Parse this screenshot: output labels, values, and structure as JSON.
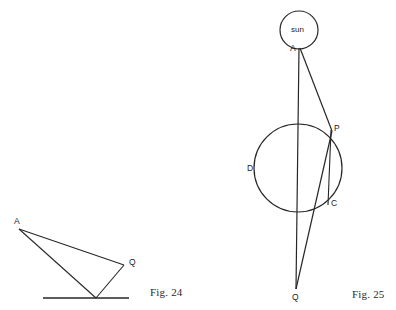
{
  "page": {
    "width": 396,
    "height": 310,
    "background": "#ffffff",
    "stroke_color": "#272727",
    "text_color": "#1d1d1d"
  },
  "figures": [
    {
      "id": "fig-24",
      "caption": "Fig. 24",
      "caption_pos": {
        "x": 150,
        "y": 286
      },
      "description": "Triangle with apex A at upper left, vertex Q at right, and a vertex on a horizontal ground line",
      "points": [
        {
          "name": "A",
          "label": "A",
          "x": 19,
          "y": 229,
          "label_x": 14,
          "label_y": 217
        },
        {
          "name": "Q",
          "label": "Q",
          "x": 124,
          "y": 265,
          "label_x": 129,
          "label_y": 258
        },
        {
          "name": "B",
          "label": "",
          "x": 96,
          "y": 298,
          "label_x": 0,
          "label_y": 0
        }
      ],
      "segments": [
        {
          "from": "A",
          "to": "Q"
        },
        {
          "from": "A",
          "to": "B"
        },
        {
          "from": "Q",
          "to": "B"
        }
      ],
      "ground_line": {
        "x1": 43,
        "y1": 298,
        "x2": 129,
        "y2": 298
      }
    },
    {
      "id": "fig-25",
      "caption": "Fig. 25",
      "caption_pos": {
        "x": 352,
        "y": 288
      },
      "description": "Sun at top labelled A, rays to point Q below, passing a circle with points P, C, D",
      "sun": {
        "label": "sun",
        "cx": 299,
        "cy": 30,
        "r": 19,
        "label_x": 291,
        "label_y": 27
      },
      "circle": {
        "cx": 298,
        "cy": 168,
        "r": 44
      },
      "points": [
        {
          "name": "A",
          "label": "A",
          "x": 299,
          "y": 48,
          "label_x": 290,
          "label_y": 45
        },
        {
          "name": "P",
          "label": "P",
          "x": 331,
          "y": 130,
          "label_x": 334,
          "label_y": 124
        },
        {
          "name": "C",
          "label": "C",
          "x": 328,
          "y": 204,
          "label_x": 331,
          "label_y": 199
        },
        {
          "name": "D",
          "label": "D",
          "x": 254,
          "y": 168,
          "label_x": 248,
          "label_y": 164
        },
        {
          "name": "Q",
          "label": "Q",
          "x": 296,
          "y": 289,
          "label_x": 292,
          "label_y": 293
        }
      ],
      "segments": [
        {
          "from": "A",
          "to": "Q",
          "note": "near-vertical ray through circle centre"
        },
        {
          "from": "A",
          "to": "P",
          "note": "ray grazing circle at P"
        },
        {
          "from": "P",
          "to": "Q",
          "note": "continuation of ray past C to Q"
        },
        {
          "from": "P",
          "to": "C",
          "note": "vertical chord"
        }
      ]
    }
  ]
}
